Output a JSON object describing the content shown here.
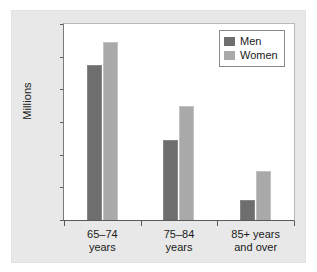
{
  "chart_data": {
    "type": "bar",
    "title": "",
    "xlabel": "",
    "ylabel": "Millions",
    "ylim": [
      0,
      12
    ],
    "yticks": [
      0,
      2,
      4,
      6,
      8,
      10,
      12
    ],
    "ytick_labels": [
      "0",
      "2",
      "4",
      "6",
      "8",
      "10",
      "12"
    ],
    "grid": false,
    "legend_position": "top-right",
    "categories": [
      "65–74\nyears",
      "75–84\nyears",
      "85+ years\nand over"
    ],
    "series": [
      {
        "name": "Men",
        "color": "#6e6e6e",
        "values": [
          9.5,
          4.9,
          1.2
        ]
      },
      {
        "name": "Women",
        "color": "#a9a9a9",
        "values": [
          10.9,
          7.0,
          3.0
        ]
      }
    ]
  },
  "legend": {
    "items": [
      {
        "label": "Men"
      },
      {
        "label": "Women"
      }
    ]
  },
  "colors": {
    "men": "#6e6e6e",
    "women": "#a9a9a9",
    "panel_background": "#e8e8e8",
    "plot_background": "#ffffff",
    "axis": "#5a5a5a",
    "text": "#1a1a1a"
  }
}
